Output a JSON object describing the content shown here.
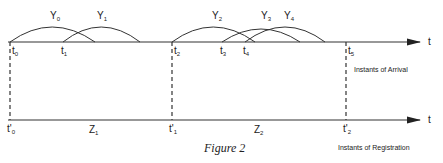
{
  "figure": {
    "caption": "Figure 2",
    "axis_symbol": "t",
    "top_axis": {
      "label": "Instants of Arrival",
      "ticks": [
        {
          "name": "t",
          "sub": "0",
          "x": 10
        },
        {
          "name": "t",
          "sub": "1",
          "x": 63
        },
        {
          "name": "t",
          "sub": "2",
          "x": 172
        },
        {
          "name": "t",
          "sub": "3",
          "x": 222
        },
        {
          "name": "t",
          "sub": "4",
          "x": 245
        },
        {
          "name": "t",
          "sub": "5",
          "x": 346
        }
      ],
      "arcs": [
        {
          "name": "Y",
          "sub": "0",
          "from": 10,
          "to": 95
        },
        {
          "name": "Y",
          "sub": "1",
          "from": 63,
          "to": 140
        },
        {
          "name": "Y",
          "sub": "2",
          "from": 172,
          "to": 255
        },
        {
          "name": "Y",
          "sub": "3",
          "from": 222,
          "to": 300
        },
        {
          "name": "Y",
          "sub": "4",
          "from": 245,
          "to": 325
        }
      ]
    },
    "bottom_axis": {
      "label": "Instants of Registration",
      "ticks": [
        {
          "name": "t'",
          "sub": "0",
          "x": 10
        },
        {
          "name": "t'",
          "sub": "1",
          "x": 172
        },
        {
          "name": "t'",
          "sub": "2",
          "x": 346
        }
      ],
      "intervals": [
        {
          "name": "Z",
          "sub": "1",
          "x": 93
        },
        {
          "name": "Z",
          "sub": "2",
          "x": 258
        }
      ]
    }
  }
}
